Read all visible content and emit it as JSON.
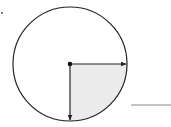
{
  "diagram": {
    "type": "circle-sector",
    "circle": {
      "cx": 70,
      "cy": 64,
      "r": 57,
      "stroke": "#222222"
    },
    "center_point": {
      "x": 70,
      "y": 64
    },
    "radii": [
      {
        "direction": "right",
        "x2": 127,
        "y2": 64
      },
      {
        "direction": "down",
        "x2": 70,
        "y2": 121
      }
    ],
    "shaded_sector": {
      "quadrant": "bottom-right",
      "fill": "#ebebeb"
    },
    "answer_line": {
      "x1": 131,
      "x2": 171,
      "y": 105,
      "stroke": "#888888"
    },
    "marker_dot": {
      "x": 2,
      "y": 13
    }
  }
}
